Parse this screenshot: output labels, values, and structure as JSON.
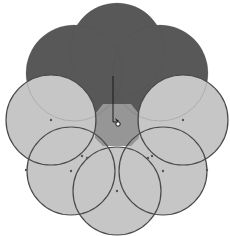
{
  "canvas": {
    "width": 230,
    "height": 236,
    "background": "#ffffff"
  },
  "colors": {
    "dark_fill": "#585858",
    "light_fill": "#c6c6c6",
    "center_fill": "#969696",
    "stroke": "#4a4a4a",
    "node": "#555555",
    "path_line": "#1a1a1a"
  },
  "merged_shape": {
    "label": "merged-top-shape",
    "circles": [
      {
        "cx": 117,
        "cy": 50,
        "r": 47
      },
      {
        "cx": 74,
        "cy": 73,
        "r": 48
      },
      {
        "cx": 160,
        "cy": 73,
        "r": 48
      },
      {
        "cx": 117,
        "cy": 85,
        "r": 40
      }
    ]
  },
  "circles": [
    {
      "name": "circle-upper-left",
      "cx": 51,
      "cy": 120,
      "r": 45,
      "node": {
        "x": 51,
        "y": 120
      }
    },
    {
      "name": "circle-upper-right",
      "cx": 183,
      "cy": 120,
      "r": 45,
      "node": {
        "x": 183,
        "y": 120
      }
    },
    {
      "name": "circle-mid-left",
      "cx": 71,
      "cy": 171,
      "r": 44,
      "node": {
        "x": 71,
        "y": 171
      }
    },
    {
      "name": "circle-mid-right",
      "cx": 163,
      "cy": 171,
      "r": 44,
      "node": {
        "x": 163,
        "y": 171
      }
    },
    {
      "name": "circle-bottom",
      "cx": 117,
      "cy": 191,
      "r": 44,
      "node": {
        "x": 117,
        "y": 191
      }
    }
  ],
  "intersection_nodes": [
    {
      "x": 82,
      "y": 156
    },
    {
      "x": 87,
      "y": 158
    },
    {
      "x": 152,
      "y": 156
    },
    {
      "x": 148,
      "y": 158
    },
    {
      "x": 26,
      "y": 170
    },
    {
      "x": 207,
      "y": 170
    }
  ],
  "center_region": {
    "points": "103,104 131,104 139,114 139,138 131,146 103,146 95,138 95,114"
  },
  "drag_path": {
    "x1": 113,
    "y1": 76,
    "x2": 113,
    "y2": 122,
    "x3": 116,
    "y3": 122
  },
  "cursor": {
    "x": 117,
    "y": 122,
    "icon": "shape-builder-cursor-icon"
  }
}
